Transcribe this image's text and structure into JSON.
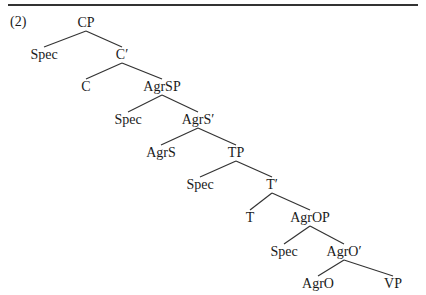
{
  "example_number": "(2)",
  "tree": {
    "root": "CP",
    "nodes": [
      {
        "id": "cp",
        "label": "CP",
        "x": 86,
        "y": 16
      },
      {
        "id": "spec-cp",
        "label": "Spec",
        "x": 44,
        "y": 48
      },
      {
        "id": "c-bar",
        "label": "C′",
        "x": 122,
        "y": 48
      },
      {
        "id": "c",
        "label": "C",
        "x": 86,
        "y": 80
      },
      {
        "id": "agrsp",
        "label": "AgrSP",
        "x": 162,
        "y": 80
      },
      {
        "id": "spec-agrsp",
        "label": "Spec",
        "x": 128,
        "y": 113
      },
      {
        "id": "agrs-bar",
        "label": "AgrS′",
        "x": 198,
        "y": 113
      },
      {
        "id": "agrs",
        "label": "AgrS",
        "x": 161,
        "y": 146
      },
      {
        "id": "tp",
        "label": "TP",
        "x": 236,
        "y": 146
      },
      {
        "id": "spec-tp",
        "label": "Spec",
        "x": 200,
        "y": 178
      },
      {
        "id": "t-bar",
        "label": "T′",
        "x": 272,
        "y": 178
      },
      {
        "id": "t",
        "label": "T",
        "x": 250,
        "y": 211
      },
      {
        "id": "agrop",
        "label": "AgrOP",
        "x": 310,
        "y": 211
      },
      {
        "id": "spec-agrop",
        "label": "Spec",
        "x": 284,
        "y": 245
      },
      {
        "id": "agro-bar",
        "label": "AgrO′",
        "x": 344,
        "y": 245
      },
      {
        "id": "agro",
        "label": "AgrO",
        "x": 318,
        "y": 277
      },
      {
        "id": "vp",
        "label": "VP",
        "x": 393,
        "y": 277
      }
    ],
    "edges": [
      [
        "cp",
        "spec-cp"
      ],
      [
        "cp",
        "c-bar"
      ],
      [
        "c-bar",
        "c"
      ],
      [
        "c-bar",
        "agrsp"
      ],
      [
        "agrsp",
        "spec-agrsp"
      ],
      [
        "agrsp",
        "agrs-bar"
      ],
      [
        "agrs-bar",
        "agrs"
      ],
      [
        "agrs-bar",
        "tp"
      ],
      [
        "tp",
        "spec-tp"
      ],
      [
        "tp",
        "t-bar"
      ],
      [
        "t-bar",
        "t"
      ],
      [
        "t-bar",
        "agrop"
      ],
      [
        "agrop",
        "spec-agrop"
      ],
      [
        "agrop",
        "agro-bar"
      ],
      [
        "agro-bar",
        "agro"
      ],
      [
        "agro-bar",
        "vp"
      ]
    ]
  },
  "colors": {
    "line": "#333333",
    "text": "#1a1a1a"
  }
}
